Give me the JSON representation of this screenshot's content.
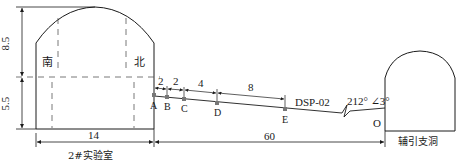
{
  "diagram": {
    "left_chamber": {
      "name": "2#实验室",
      "south_label": "南",
      "north_label": "北",
      "height_upper": "8.5",
      "height_lower": "5.5",
      "width": "14"
    },
    "right_tunnel": {
      "name": "辅引支洞"
    },
    "borehole": {
      "name": "DSP-02",
      "orientation": "212° ∠3°",
      "points": [
        "A",
        "B",
        "C",
        "D",
        "E"
      ],
      "origin_label": "O",
      "spacings": [
        "2",
        "2",
        "4",
        "8"
      ],
      "length_total": "60"
    },
    "colors": {
      "line": "#1a1a1a",
      "dashed": "#555555",
      "point_marker": "#777777"
    }
  }
}
